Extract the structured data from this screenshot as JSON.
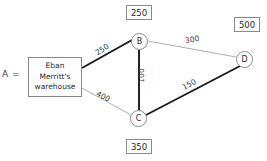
{
  "diagram": {
    "prefix_label": "A =",
    "source": {
      "name": "warehouse-box",
      "lines": [
        "Eban",
        "Merritt's",
        "warehouse"
      ]
    },
    "nodes": [
      {
        "id": "B",
        "label": "B"
      },
      {
        "id": "C",
        "label": "C"
      },
      {
        "id": "D",
        "label": "D"
      }
    ],
    "node_values": [
      {
        "node": "B",
        "value": "250"
      },
      {
        "node": "D",
        "value": "500"
      },
      {
        "node": "C",
        "value": "350"
      }
    ],
    "edges": [
      {
        "from": "A",
        "to": "B",
        "cost": "250",
        "emphasis": "bold"
      },
      {
        "from": "A",
        "to": "C",
        "cost": "400",
        "emphasis": "thin"
      },
      {
        "from": "B",
        "to": "C",
        "cost": "100",
        "emphasis": "bold"
      },
      {
        "from": "B",
        "to": "D",
        "cost": "300",
        "emphasis": "thin"
      },
      {
        "from": "C",
        "to": "D",
        "cost": "150",
        "emphasis": "bold"
      }
    ],
    "colors": {
      "bold_edge": "#1a1a1a",
      "thin_edge": "#9a9a9a",
      "outline": "#8a8a8a",
      "text": "#2b2b2b",
      "background": "#ffffff"
    }
  }
}
